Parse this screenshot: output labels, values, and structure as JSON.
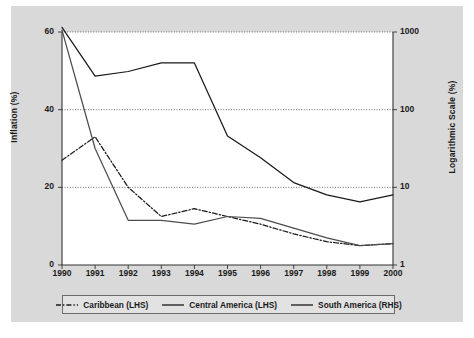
{
  "chart_data": {
    "type": "line",
    "title": "",
    "xlabel": "",
    "ylabel": "Inflation (%)",
    "ylabel_right": "Logarithmic Scale (%)",
    "grid": true,
    "legend_position": "bottom",
    "x": [
      "1990",
      "1991",
      "1992",
      "1993",
      "1994",
      "1995",
      "1996",
      "1997",
      "1998",
      "1999",
      "2000"
    ],
    "categories": [
      "1990",
      "1991",
      "1992",
      "1993",
      "1994",
      "1995",
      "1996",
      "1997",
      "1998",
      "1999",
      "2000"
    ],
    "y_left_ticks": [
      "0",
      "20",
      "40",
      "60"
    ],
    "y_left_tick_values": [
      0,
      20,
      40,
      60
    ],
    "ylim": [
      0,
      60
    ],
    "y_right_ticks": [
      "1",
      "10",
      "100",
      "1000"
    ],
    "y_right_tick_values": [
      1,
      10,
      100,
      1000
    ],
    "ylim_right": [
      1,
      1000
    ],
    "y_right_scale": "log",
    "series": [
      {
        "name": "Caribbean (LHS)",
        "axis": "left",
        "style": "dash-dot",
        "color": "#1a1a1a",
        "values": [
          27.0,
          33.0,
          20.0,
          12.5,
          14.5,
          12.5,
          10.5,
          8.0,
          6.0,
          5.0,
          5.5
        ]
      },
      {
        "name": "Central America (LHS)",
        "axis": "left",
        "style": "solid",
        "color": "#4d4d4d",
        "values": [
          60.5,
          30.0,
          11.5,
          11.5,
          10.5,
          12.5,
          12.0,
          9.5,
          7.0,
          5.0,
          5.5
        ]
      },
      {
        "name": "South America (RHS)",
        "axis": "right",
        "style": "solid",
        "color": "#1a1a1a",
        "values": [
          1150,
          270,
          310,
          400,
          400,
          46,
          24,
          11.5,
          8.0,
          6.5,
          8.0
        ]
      }
    ],
    "legend": [
      {
        "label": "Caribbean (LHS)",
        "style": "dash-dot"
      },
      {
        "label": "Central America (LHS)",
        "style": "solid"
      },
      {
        "label": "South America (RHS)",
        "style": "solid"
      }
    ]
  }
}
